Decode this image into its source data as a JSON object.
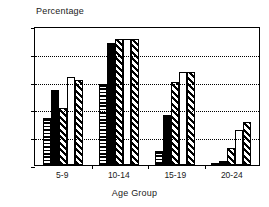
{
  "chart_data": {
    "type": "bar",
    "title": "",
    "xlabel": "Age Group",
    "ylabel": "Percentage",
    "categories": [
      "5-9",
      "10-14",
      "15-19",
      "20-24"
    ],
    "ylim": [
      0,
      100
    ],
    "yticks": [
      0,
      20,
      40,
      60,
      80,
      100
    ],
    "ytick_labels": [
      "0",
      "20",
      "40",
      "60",
      "80",
      "100"
    ],
    "grid": true,
    "grid_style": "dotted-horizontal",
    "legend": "none",
    "series": [
      {
        "name": "series-1",
        "pattern": "horizontal-lines",
        "values": [
          34,
          58,
          10,
          1
        ]
      },
      {
        "name": "series-2",
        "pattern": "solid-black",
        "values": [
          54,
          88,
          36,
          3
        ]
      },
      {
        "name": "series-3",
        "pattern": "diagonal-hatch",
        "values": [
          41,
          91,
          60,
          12
        ]
      },
      {
        "name": "series-4",
        "pattern": "blank-white",
        "values": [
          63,
          91,
          67,
          25
        ]
      },
      {
        "name": "series-5",
        "pattern": "diagonal-hatch",
        "values": [
          61,
          91,
          67,
          31
        ]
      }
    ]
  },
  "axis": {
    "y_title": "Percentage",
    "x_title": "Age Group"
  }
}
